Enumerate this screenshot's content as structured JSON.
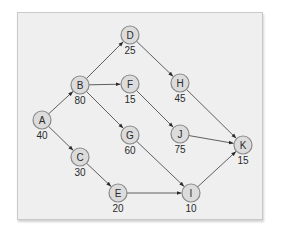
{
  "diagram": {
    "type": "directed-network",
    "colors": {
      "node_fill": "#dcdcdc",
      "node_stroke": "#8a8a8a",
      "edge": "#3a3a3a",
      "panel_background": "#efefef"
    },
    "nodes": [
      {
        "id": "A",
        "value": "40",
        "x": 42,
        "y": 120
      },
      {
        "id": "B",
        "value": "80",
        "x": 80,
        "y": 85
      },
      {
        "id": "C",
        "value": "30",
        "x": 80,
        "y": 157
      },
      {
        "id": "D",
        "value": "25",
        "x": 130,
        "y": 35
      },
      {
        "id": "E",
        "value": "20",
        "x": 118,
        "y": 193
      },
      {
        "id": "F",
        "value": "15",
        "x": 130,
        "y": 84
      },
      {
        "id": "G",
        "value": "60",
        "x": 130,
        "y": 135
      },
      {
        "id": "H",
        "value": "45",
        "x": 180,
        "y": 83
      },
      {
        "id": "I",
        "value": "10",
        "x": 191,
        "y": 193
      },
      {
        "id": "J",
        "value": "75",
        "x": 180,
        "y": 134
      },
      {
        "id": "K",
        "value": "15",
        "x": 243,
        "y": 145
      }
    ],
    "edges": [
      {
        "from": "A",
        "to": "B"
      },
      {
        "from": "A",
        "to": "C"
      },
      {
        "from": "B",
        "to": "D"
      },
      {
        "from": "B",
        "to": "F"
      },
      {
        "from": "B",
        "to": "G"
      },
      {
        "from": "C",
        "to": "E"
      },
      {
        "from": "D",
        "to": "H"
      },
      {
        "from": "F",
        "to": "J"
      },
      {
        "from": "G",
        "to": "I"
      },
      {
        "from": "E",
        "to": "I"
      },
      {
        "from": "H",
        "to": "K"
      },
      {
        "from": "J",
        "to": "K"
      },
      {
        "from": "I",
        "to": "K"
      }
    ]
  }
}
